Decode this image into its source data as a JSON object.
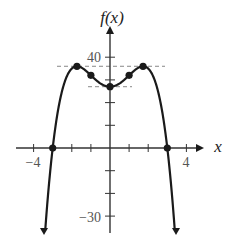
{
  "chart_data": {
    "type": "line",
    "title": "",
    "function": "f(x) = -x^4 + 6x^2 + 27",
    "xlabel": "x",
    "ylabel": "f(x)",
    "xlim": [
      -4.5,
      5
    ],
    "ylim": [
      -37,
      52
    ],
    "x_ticks": [
      -4,
      -3,
      -2,
      -1,
      0,
      1,
      2,
      3,
      4
    ],
    "x_tick_labels": {
      "-4": "-4",
      "4": "4"
    },
    "y_ticks": [
      -30,
      -20,
      -10,
      10,
      20,
      30,
      40
    ],
    "y_tick_labels": {
      "40": "40",
      "-30": "−30"
    },
    "grid": false,
    "marked_points": [
      {
        "x": -3,
        "y": 0,
        "kind": "zero"
      },
      {
        "x": -1.73,
        "y": 36,
        "kind": "local-max"
      },
      {
        "x": -1,
        "y": 32,
        "kind": "inflection"
      },
      {
        "x": 0,
        "y": 27,
        "kind": "local-min"
      },
      {
        "x": 1,
        "y": 32,
        "kind": "inflection"
      },
      {
        "x": 1.73,
        "y": 36,
        "kind": "local-max"
      },
      {
        "x": 3,
        "y": 0,
        "kind": "zero"
      }
    ],
    "dashed_lines": [
      {
        "y": 36,
        "kind": "horizontal-tangent"
      },
      {
        "y": 27,
        "kind": "horizontal-tangent"
      }
    ]
  },
  "labels": {
    "y_axis": "f(x)",
    "x_axis": "x",
    "tick_40": "40",
    "tick_neg30": "−30",
    "tick_neg4": "−4",
    "tick_4": "4"
  },
  "colors": {
    "curve": "#1a1a1a",
    "axis": "#333333",
    "dashed": "#888888"
  }
}
